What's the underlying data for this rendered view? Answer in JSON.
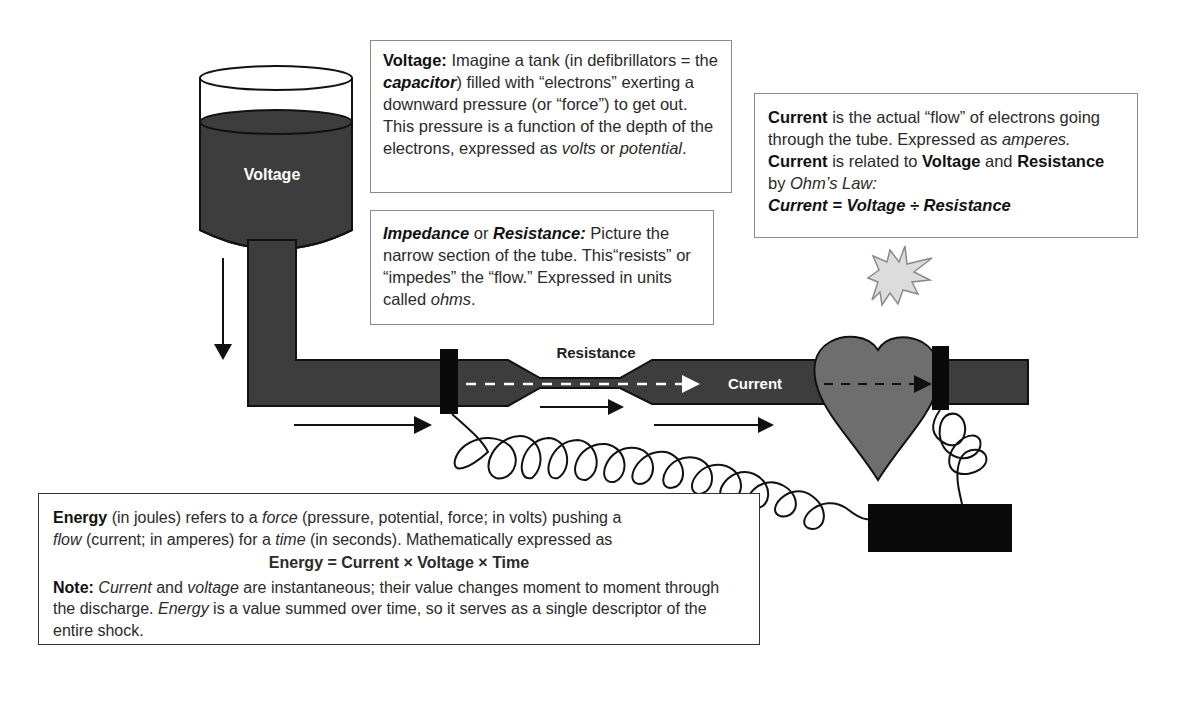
{
  "diagram": {
    "type": "defibrillation-electricity-analogy",
    "tank": {
      "label": "Voltage"
    },
    "tube": {
      "resistance_label": "Resistance",
      "current_label": "Current"
    },
    "colors": {
      "fluid": "#3d3d3d",
      "heart": "#6e6e6e",
      "electrode": "#0a0a0a",
      "spark_fill": "#dcdcdc",
      "spark_stroke": "#8a8a8a",
      "box_border": "#8a8a8a"
    }
  },
  "voltage_box": {
    "term": "Voltage:",
    "t1": " Imagine a tank (in defibrillators = the ",
    "capacitor": "capacitor",
    "t2": ") filled with “electrons” exerting a downward pressure (or “force”) to get out. This pressure is a function of the depth of the electrons, expressed as ",
    "volts": "volts",
    "t3": " or ",
    "potential": "potential",
    "t4": "."
  },
  "impedance_box": {
    "term1": "Impedance",
    "t1": " or ",
    "term2": "Resistance:",
    "t2": " Picture the narrow section of the tube. This“resists” or “impedes” the “flow.” Expressed in units called ",
    "ohms": "ohms",
    "t3": "."
  },
  "current_box": {
    "term": "Current",
    "t1": " is the actual “flow” of electrons going through the tube. Expressed as ",
    "amperes": "amperes.",
    "t2": " ",
    "term2": "Current",
    "t3": " is related to ",
    "term3": "Voltage",
    "t4": " and ",
    "term4": "Resistance",
    "t5": " by ",
    "law": "Ohm’s Law:",
    "formula": "Current = Voltage ÷ Resistance"
  },
  "energy_box": {
    "term": "Energy",
    "t1": " (in joules) refers to a ",
    "force": "force",
    "t2": " (pressure, potential, force; in volts) pushing a ",
    "flow": "flow",
    "t3": " (current; in amperes) for a ",
    "time": "time",
    "t4": " (in seconds). Mathematically expressed as",
    "formula": "Energy = Current × Voltage × Time",
    "note_label": "Note:",
    "n_current": "Current",
    "n1": " and ",
    "n_voltage": "voltage",
    "n2": " are instantaneous; their value changes moment to moment through the discharge. ",
    "n_energy": "Energy",
    "n3": " is a value summed over time, so it serves as a single descriptor of the entire shock."
  }
}
